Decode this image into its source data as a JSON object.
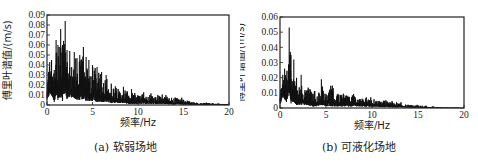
{
  "chart_data": [
    {
      "type": "line",
      "caption": "(a) 软弱场地",
      "title": "",
      "xlabel": "频率/Hz",
      "ylabel": "傅里叶谱值/(m/s)",
      "xlim": [
        0,
        20
      ],
      "ylim": [
        0,
        0.09
      ],
      "xticks": [
        0,
        5,
        10,
        15,
        20
      ],
      "yticks": [
        0,
        0.01,
        0.02,
        0.03,
        0.04,
        0.05,
        0.06,
        0.07,
        0.08,
        0.09
      ],
      "ytick_labels": [
        "0",
        "0.01",
        "0.02",
        "0.03",
        "0.04",
        "0.05",
        "0.06",
        "0.07",
        "0.08",
        "0.09"
      ],
      "grid": false,
      "series": [
        {
          "name": "Fourier amplitude spectrum (soft site)",
          "envelope_x": [
            0,
            0.3,
            0.5,
            0.8,
            1.0,
            1.2,
            1.5,
            1.7,
            2.0,
            2.2,
            2.5,
            3.0,
            3.3,
            3.6,
            4.0,
            4.3,
            4.6,
            5.0,
            5.5,
            6.0,
            6.5,
            7.0,
            7.5,
            8.0,
            8.5,
            9.0,
            10.0,
            11.0,
            12.0,
            13.0,
            14.0,
            15.0,
            16.0,
            17.0,
            18.0,
            19.0,
            20.0
          ],
          "peak_values": [
            0.02,
            0.043,
            0.045,
            0.035,
            0.065,
            0.06,
            0.076,
            0.06,
            0.084,
            0.055,
            0.054,
            0.053,
            0.047,
            0.05,
            0.058,
            0.048,
            0.045,
            0.04,
            0.038,
            0.033,
            0.03,
            0.025,
            0.022,
            0.02,
            0.019,
            0.018,
            0.016,
            0.014,
            0.012,
            0.011,
            0.009,
            0.007,
            0.004,
            0.003,
            0.002,
            0.0015,
            0.001
          ],
          "trough_values": [
            0.005,
            0.012,
            0.01,
            0.003,
            0.01,
            0.005,
            0.008,
            0.004,
            0.012,
            0.006,
            0.008,
            0.007,
            0.005,
            0.005,
            0.006,
            0.004,
            0.004,
            0.004,
            0.003,
            0.003,
            0.003,
            0.002,
            0.002,
            0.002,
            0.002,
            0.001,
            0.001,
            0.001,
            0.001,
            0.0008,
            0.0006,
            0.0005,
            0.0003,
            0.0002,
            0.0001,
            0.0001,
            0.0
          ]
        }
      ]
    },
    {
      "type": "line",
      "caption": "(b) 可液化场地",
      "title": "",
      "xlabel": "频率/Hz",
      "ylabel": "傅里叶谱值/(m/s)",
      "xlim": [
        0,
        20
      ],
      "ylim": [
        0,
        0.06
      ],
      "xticks": [
        0,
        5,
        10,
        15,
        20
      ],
      "yticks": [
        0,
        0.01,
        0.02,
        0.03,
        0.04,
        0.05,
        0.06
      ],
      "ytick_labels": [
        "0",
        "0.01",
        "0.02",
        "0.03",
        "0.04",
        "0.05",
        "0.06"
      ],
      "grid": false,
      "series": [
        {
          "name": "Fourier amplitude spectrum (liquefiable site)",
          "envelope_x": [
            0,
            0.3,
            0.5,
            0.7,
            1.0,
            1.2,
            1.5,
            1.8,
            2.0,
            2.3,
            2.6,
            3.0,
            3.5,
            4.0,
            4.5,
            5.0,
            5.5,
            6.0,
            6.5,
            7.0,
            7.5,
            8.0,
            9.0,
            10.0,
            11.0,
            12.0,
            13.0,
            14.0,
            15.0,
            16.0,
            17.0,
            18.0,
            19.0,
            20.0
          ],
          "peak_values": [
            0.01,
            0.022,
            0.026,
            0.02,
            0.053,
            0.035,
            0.032,
            0.02,
            0.018,
            0.022,
            0.015,
            0.014,
            0.013,
            0.014,
            0.019,
            0.013,
            0.016,
            0.015,
            0.013,
            0.012,
            0.013,
            0.011,
            0.009,
            0.008,
            0.006,
            0.005,
            0.004,
            0.003,
            0.002,
            0.0015,
            0.001,
            0.0005,
            0.0003,
            0.0002
          ],
          "trough_values": [
            0.002,
            0.008,
            0.006,
            0.004,
            0.01,
            0.003,
            0.004,
            0.002,
            0.002,
            0.002,
            0.002,
            0.002,
            0.001,
            0.001,
            0.002,
            0.001,
            0.001,
            0.001,
            0.001,
            0.001,
            0.001,
            0.001,
            0.001,
            0.0008,
            0.0006,
            0.0005,
            0.0004,
            0.0003,
            0.0002,
            0.0001,
            0.0001,
            0.0,
            0.0,
            0.0
          ]
        }
      ]
    }
  ],
  "panels": {
    "a": {
      "caption": "(a) 软弱场地",
      "xlabel": "频率/Hz",
      "ylabel": "傅里叶谱值/(m/s)"
    },
    "b": {
      "caption": "(b) 可液化场地",
      "xlabel": "频率/Hz",
      "ylabel": "傅里叶谱值/(m/s)"
    }
  }
}
